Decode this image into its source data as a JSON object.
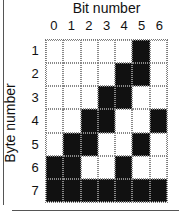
{
  "title": "Bit number",
  "ylabel": "Byte number",
  "columns": [
    "0",
    "1",
    "2",
    "3",
    "4",
    "5",
    "6"
  ],
  "rows": [
    "1",
    "2",
    "3",
    "4",
    "5",
    "6",
    "7"
  ],
  "colors": {
    "on": "#111111",
    "off": "#ffffff"
  },
  "grid": [
    [
      0,
      0,
      0,
      0,
      0,
      1,
      0
    ],
    [
      0,
      0,
      0,
      0,
      1,
      1,
      0
    ],
    [
      0,
      0,
      0,
      1,
      1,
      0,
      0
    ],
    [
      0,
      0,
      1,
      1,
      0,
      0,
      1
    ],
    [
      0,
      1,
      1,
      0,
      0,
      1,
      0
    ],
    [
      1,
      1,
      0,
      0,
      1,
      0,
      0
    ],
    [
      1,
      1,
      1,
      1,
      1,
      1,
      1
    ]
  ]
}
